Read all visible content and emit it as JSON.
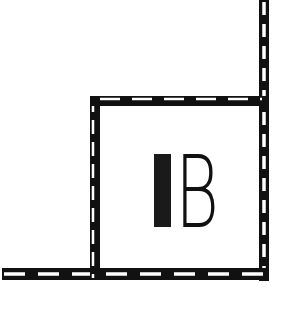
{
  "diagram": {
    "type": "map-symbol",
    "background": "#ffffff",
    "line_color": "#111111",
    "dash_color": "#ffffff",
    "building": {
      "label": "B",
      "marker": "solid-bar",
      "x": 91,
      "y": 97,
      "width": 176,
      "height": 182
    },
    "lines": [
      {
        "name": "right-vertical-boundary",
        "x1": 264,
        "y1": 0,
        "x2": 264,
        "y2": 280
      },
      {
        "name": "bottom-horizontal-boundary",
        "x1": 0,
        "y1": 274,
        "x2": 268,
        "y2": 274
      },
      {
        "name": "left-vertical-boundary",
        "x1": 95,
        "y1": 97,
        "x2": 95,
        "y2": 280
      },
      {
        "name": "top-horizontal-boundary",
        "x1": 91,
        "y1": 101,
        "x2": 268,
        "y2": 101
      }
    ]
  }
}
